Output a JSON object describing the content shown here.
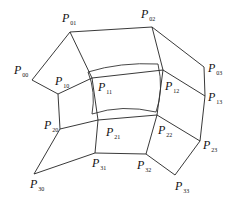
{
  "diagram": {
    "control_points": [
      {
        "id": "P00",
        "label": "P",
        "sub": "00",
        "x": 32,
        "y": 80,
        "lx": 14,
        "ly": 64
      },
      {
        "id": "P01",
        "label": "P",
        "sub": "01",
        "x": 70,
        "y": 32,
        "lx": 62,
        "ly": 12
      },
      {
        "id": "P02",
        "label": "P",
        "sub": "02",
        "x": 152,
        "y": 27,
        "lx": 141,
        "ly": 8
      },
      {
        "id": "P03",
        "label": "P",
        "sub": "03",
        "x": 204,
        "y": 67,
        "lx": 208,
        "ly": 62
      },
      {
        "id": "P10",
        "label": "P",
        "sub": "10",
        "x": 58,
        "y": 94,
        "lx": 55,
        "ly": 75
      },
      {
        "id": "P11",
        "label": "P",
        "sub": "11",
        "x": 92,
        "y": 78,
        "lx": 98,
        "ly": 81
      },
      {
        "id": "P12",
        "label": "P",
        "sub": "12",
        "x": 163,
        "y": 70,
        "lx": 165,
        "ly": 80
      },
      {
        "id": "P13",
        "label": "P",
        "sub": "13",
        "x": 205,
        "y": 96,
        "lx": 208,
        "ly": 91
      },
      {
        "id": "P20",
        "label": "P",
        "sub": "20",
        "x": 60,
        "y": 129,
        "lx": 44,
        "ly": 119
      },
      {
        "id": "P21",
        "label": "P",
        "sub": "21",
        "x": 98,
        "y": 120,
        "lx": 106,
        "ly": 126
      },
      {
        "id": "P22",
        "label": "P",
        "sub": "22",
        "x": 157,
        "y": 115,
        "lx": 158,
        "ly": 124
      },
      {
        "id": "P23",
        "label": "P",
        "sub": "23",
        "x": 200,
        "y": 141,
        "lx": 203,
        "ly": 139
      },
      {
        "id": "P30",
        "label": "P",
        "sub": "30",
        "x": 34,
        "y": 174,
        "lx": 30,
        "ly": 178
      },
      {
        "id": "P31",
        "label": "P",
        "sub": "31",
        "x": 95,
        "y": 153,
        "lx": 92,
        "ly": 157
      },
      {
        "id": "P32",
        "label": "P",
        "sub": "32",
        "x": 146,
        "y": 154,
        "lx": 137,
        "ly": 159
      },
      {
        "id": "P33",
        "label": "P",
        "sub": "33",
        "x": 175,
        "y": 175,
        "lx": 175,
        "ly": 180
      }
    ],
    "net_color": "#222222",
    "surface_color": "#333333"
  }
}
